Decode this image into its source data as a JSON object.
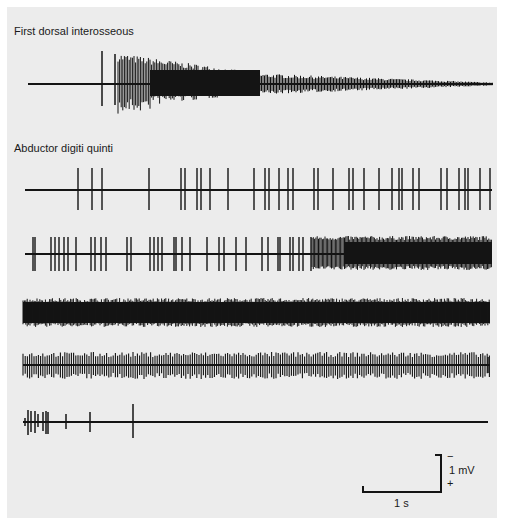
{
  "figure": {
    "background_color": "#ececec",
    "trace_color": "#141414",
    "sections": [
      {
        "title": "First dorsal interosseous",
        "traces": [
          {
            "id": 1,
            "baseline_y": 84,
            "x_start": 28,
            "x_end": 493,
            "pattern": "two isolated spikes then dense high-amplitude burst decaying to flat baseline"
          }
        ]
      },
      {
        "title": "Abductor digiti quinti",
        "traces": [
          {
            "id": 2,
            "baseline_y": 190,
            "x_start": 25,
            "x_end": 492,
            "pattern": "sparse single-unit firing, irregular spikes"
          },
          {
            "id": 3,
            "baseline_y": 254,
            "x_start": 25,
            "x_end": 492,
            "pattern": "regular spike trains increasing in density to interference pattern"
          },
          {
            "id": 4,
            "baseline_y": 313,
            "x_start": 23,
            "x_end": 490,
            "pattern": "full dense interference pattern"
          },
          {
            "id": 5,
            "baseline_y": 365,
            "x_start": 23,
            "x_end": 490,
            "pattern": "dense multiunit firing, individual spikes visible"
          },
          {
            "id": 6,
            "baseline_y": 422,
            "x_start": 23,
            "x_end": 488,
            "pattern": "few spikes at start then silent baseline"
          }
        ]
      }
    ],
    "scale_bar": {
      "time_label": "1 s",
      "voltage_label": "1 mV",
      "minus_sign": "−",
      "plus_sign": "+"
    }
  }
}
